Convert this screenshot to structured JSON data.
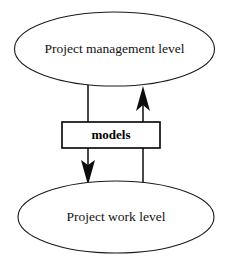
{
  "diagram": {
    "type": "two-level-model-flow",
    "background_color": "#ffffff",
    "stroke_color": "#1a1a1a",
    "nodes": [
      {
        "id": "project-management-level",
        "shape": "ellipse",
        "label": "Project management level",
        "cx": 114.5,
        "cy": 49,
        "rx": 100,
        "ry": 37
      },
      {
        "id": "models",
        "shape": "rectangle",
        "label": "models",
        "x": 62,
        "y": 122,
        "width": 98,
        "height": 26
      },
      {
        "id": "project-work-level",
        "shape": "ellipse",
        "label": "Project work level",
        "cx": 116,
        "cy": 217,
        "rx": 98,
        "ry": 36
      }
    ],
    "edges": [
      {
        "id": "management-to-work",
        "direction": "down",
        "from": "project-management-level",
        "to": "project-work-level",
        "through": "models",
        "x": 88,
        "arrowhead": "down"
      },
      {
        "id": "work-to-management",
        "direction": "up",
        "from": "project-work-level",
        "to": "project-management-level",
        "through": "models",
        "x": 143,
        "arrowhead": "up"
      }
    ]
  }
}
